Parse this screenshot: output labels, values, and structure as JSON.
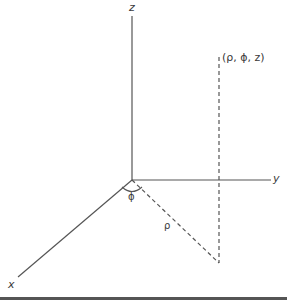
{
  "diagram": {
    "type": "cylindrical-coordinate-system",
    "axes": {
      "z": {
        "label": "z"
      },
      "y": {
        "label": "y"
      },
      "x": {
        "label": "x"
      }
    },
    "point_label": "(ρ, ϕ, z)",
    "angle_label": "ϕ",
    "radius_label": "ρ",
    "colors": {
      "axis": "#555555",
      "dashed": "#555555",
      "text": "#3a3a3a",
      "rule": "#555555",
      "background": "#ffffff"
    }
  }
}
